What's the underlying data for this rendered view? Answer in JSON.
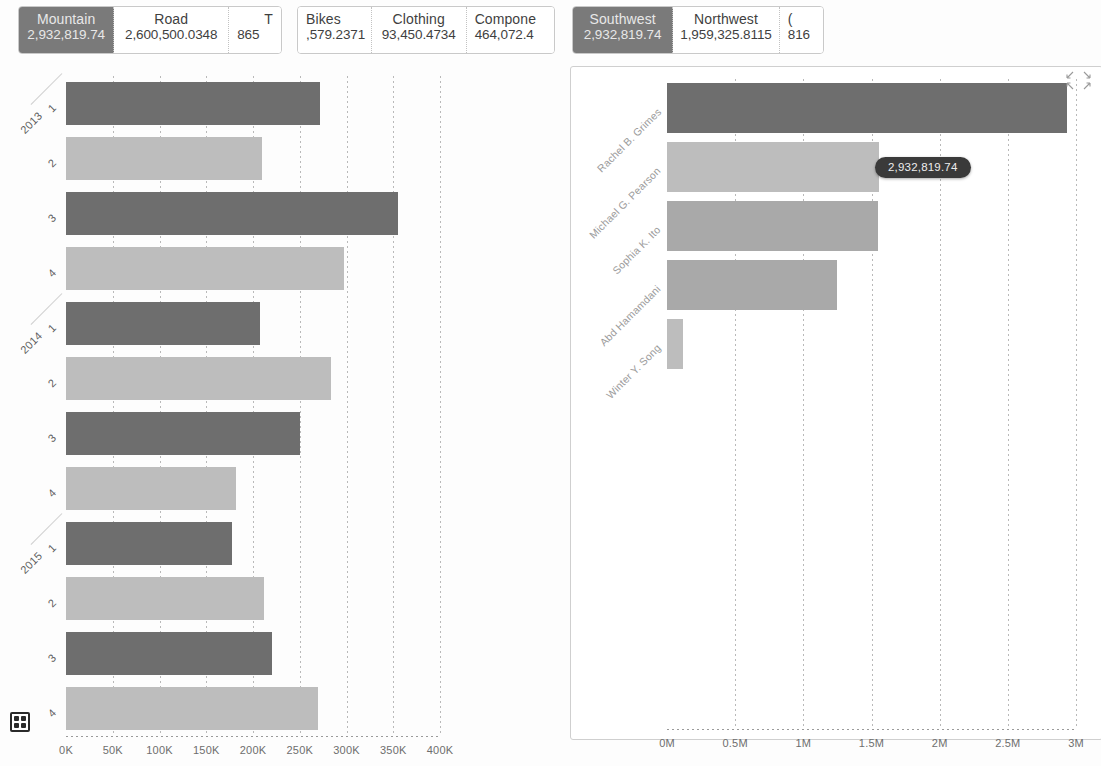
{
  "filters": {
    "product_strip": {
      "name": "product-subcategory-filter",
      "cards": [
        {
          "title": "Mountain",
          "value": "2,932,819.74",
          "selected": true
        },
        {
          "title": "Road",
          "value": "2,600,500.0348",
          "selected": false
        },
        {
          "title": "T",
          "value": "865",
          "selected": false
        }
      ]
    },
    "category_strip": {
      "name": "product-category-filter",
      "cards": [
        {
          "title": "Bikes",
          "value": ",579.2371",
          "selected": false
        },
        {
          "title": "Clothing",
          "value": "93,450.4734",
          "selected": false
        },
        {
          "title": "Compone",
          "value": "464,072.4",
          "selected": false
        }
      ]
    },
    "region_strip": {
      "name": "sales-territory-filter",
      "cards": [
        {
          "title": "Southwest",
          "value": "2,932,819.74",
          "selected": true
        },
        {
          "title": "Northwest",
          "value": "1,959,325.8115",
          "selected": false
        },
        {
          "title": "(",
          "value": "816",
          "selected": false
        }
      ]
    }
  },
  "chart_data": [
    {
      "id": "left",
      "type": "bar",
      "orientation": "horizontal",
      "title": "",
      "xlabel": "",
      "ylabel": "",
      "xlim": [
        0,
        400000
      ],
      "xticks": [
        "0K",
        "50K",
        "100K",
        "150K",
        "200K",
        "250K",
        "300K",
        "350K",
        "400K"
      ],
      "xtick_values": [
        0,
        50000,
        100000,
        150000,
        200000,
        250000,
        300000,
        350000,
        400000
      ],
      "grid": true,
      "legend": "none",
      "group_labels": [
        "2013",
        "2014",
        "2015"
      ],
      "categories": [
        {
          "year": "2013",
          "quarter": "1"
        },
        {
          "year": "2013",
          "quarter": "2"
        },
        {
          "year": "2013",
          "quarter": "3"
        },
        {
          "year": "2013",
          "quarter": "4"
        },
        {
          "year": "2014",
          "quarter": "1"
        },
        {
          "year": "2014",
          "quarter": "2"
        },
        {
          "year": "2014",
          "quarter": "3"
        },
        {
          "year": "2014",
          "quarter": "4"
        },
        {
          "year": "2015",
          "quarter": "1"
        },
        {
          "year": "2015",
          "quarter": "2"
        },
        {
          "year": "2015",
          "quarter": "3"
        },
        {
          "year": "2015",
          "quarter": "4"
        }
      ],
      "values": [
        272000,
        210000,
        355000,
        297000,
        208000,
        283000,
        250000,
        182000,
        178000,
        212000,
        220000,
        270000
      ],
      "bar_shades": [
        "dark",
        "light",
        "dark",
        "light",
        "dark",
        "light",
        "dark",
        "light",
        "dark",
        "light",
        "dark",
        "light"
      ],
      "colors": {
        "dark": "#6e6e6e",
        "light": "#bdbdbd"
      }
    },
    {
      "id": "right",
      "type": "bar",
      "orientation": "horizontal",
      "title": "",
      "xlabel": "",
      "ylabel": "",
      "xlim": [
        0,
        3000000
      ],
      "xticks": [
        "0M",
        "0.5M",
        "1M",
        "1.5M",
        "2M",
        "2.5M",
        "3M"
      ],
      "xtick_values": [
        0,
        500000,
        1000000,
        1500000,
        2000000,
        2500000,
        3000000
      ],
      "grid": true,
      "legend": "none",
      "categories": [
        "Rachel B. Grimes",
        "Michael G. Pearson",
        "Sophia K. Ito",
        "Abd Hamamdani",
        "Winter Y. Song"
      ],
      "values": [
        2932819.74,
        1555000,
        1545000,
        1250000,
        120000
      ],
      "bar_shades": [
        "dark",
        "light",
        "mid",
        "mid",
        "light"
      ],
      "colors": {
        "dark": "#6e6e6e",
        "mid": "#a9a9a9",
        "light": "#bdbdbd"
      },
      "annotation": {
        "label": "2,932,819.74",
        "series_index": 1
      }
    }
  ],
  "tooltip": {
    "text": "2,932,819.74"
  },
  "icons": {
    "grid": "grid-view-icon",
    "expand_tl": "expand-arrow-top-left-icon",
    "expand_tr": "expand-arrow-top-right-icon",
    "expand_bl": "expand-arrow-bottom-left-icon",
    "expand_br": "expand-arrow-bottom-right-icon"
  }
}
